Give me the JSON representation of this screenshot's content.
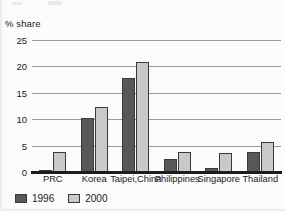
{
  "chart_data": {
    "type": "bar",
    "title": "",
    "subtitle": "",
    "ylabel": "% share",
    "xlabel": "",
    "ylim": [
      0,
      25
    ],
    "yticks": [
      0,
      5,
      10,
      15,
      20,
      25
    ],
    "grid": true,
    "legend_position": "bottom-left",
    "categories": [
      "PRC",
      "Korea",
      "Taipei,China",
      "Philippines",
      "Singapore",
      "Thailand"
    ],
    "series": [
      {
        "name": "1996",
        "color": "#585858",
        "values": [
          0.2,
          10.2,
          17.9,
          2.5,
          0.7,
          3.8
        ]
      },
      {
        "name": "2000",
        "color": "#c9c9c9",
        "values": [
          3.8,
          12.3,
          20.9,
          3.8,
          3.6,
          5.6
        ]
      }
    ]
  },
  "colors": {
    "series_1996": "#585858",
    "series_2000": "#c9c9c9",
    "gridline": "#9a9a9a",
    "axis": "#1c1c1c",
    "background": "#fbfbfb",
    "text": "#1a1a1a"
  }
}
